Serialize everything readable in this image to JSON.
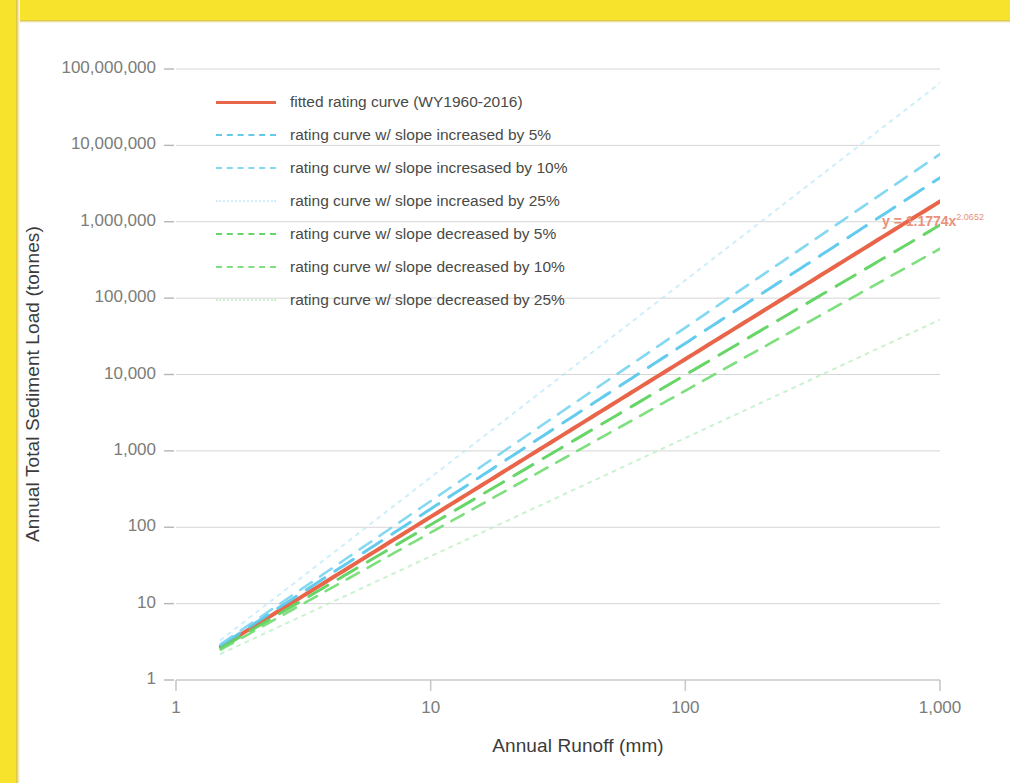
{
  "frame": {
    "border_color": "#F7E32B"
  },
  "chart_data": {
    "type": "line",
    "title": "",
    "xlabel": "Annual Runoff (mm)",
    "ylabel": "Annual Total Sediment Load (tonnes)",
    "xscale": "log",
    "yscale": "log",
    "xlim": [
      1,
      1000
    ],
    "ylim": [
      1,
      100000000
    ],
    "xticks": [
      1,
      10,
      100,
      1000
    ],
    "xtick_labels": [
      "1",
      "10",
      "100",
      "1,000"
    ],
    "yticks": [
      1,
      10,
      100,
      1000,
      10000,
      100000,
      1000000,
      10000000,
      100000000
    ],
    "ytick_labels": [
      "1",
      "10",
      "100",
      "1,000",
      "10,000",
      "100,000",
      "1,000,000",
      "10,000,000",
      "100,000,000"
    ],
    "grid": "horizontal",
    "grid_color": "#b6b6b6",
    "legend_position": "upper left",
    "annotations": [
      {
        "name": "fitted-equation",
        "text_base": "y = 1.1774x",
        "text_exponent": "2.0652",
        "color": "#E8917B",
        "x": 1000,
        "y": 1800000
      }
    ],
    "x_domain_start": 1.5,
    "x_domain_end": 1000,
    "coefficient": 1.1774,
    "exponent": 2.0652,
    "series": [
      {
        "name": "fitted rating curve (WY1960-2016)",
        "label": "fitted rating curve (WY1960-2016)",
        "color": "#E8654A",
        "dash": "none",
        "width": 4,
        "opacity": 1,
        "slope_factor": 1.0,
        "exponent": 2.0652,
        "y_at_x1000": 1795000
      },
      {
        "name": "rating curve w/ slope increased by 5%",
        "label": "rating curve w/ slope increased by 5%",
        "color": "#5BC8EC",
        "dash": "long",
        "width": 3,
        "opacity": 0.95,
        "slope_factor": 1.05,
        "exponent": 2.16846,
        "y_at_x1000": 3990000
      },
      {
        "name": "rating curve w/ slope incresased by 10%",
        "label": "rating curve w/ slope incresased by 10%",
        "color": "#77D4F0",
        "dash": "medium",
        "width": 2.6,
        "opacity": 0.9,
        "slope_factor": 1.1,
        "exponent": 2.27172,
        "y_at_x1000": 8860000
      },
      {
        "name": "rating curve w/ slope increased by 25%",
        "label": "rating curve w/ slope increased by 25%",
        "color": "#BEE9F8",
        "dash": "dotted",
        "width": 2,
        "opacity": 0.75,
        "slope_factor": 1.25,
        "exponent": 2.5815,
        "y_at_x1000": 62000000
      },
      {
        "name": "rating curve w/ slope decreased by 5%",
        "label": "rating curve w/ slope decreased by 5%",
        "color": "#5FD35F",
        "dash": "long",
        "width": 3,
        "opacity": 0.95,
        "slope_factor": 0.95,
        "exponent": 1.96194,
        "y_at_x1000": 809000
      },
      {
        "name": "rating curve w/ slope decreased by 10%",
        "label": "rating curve w/ slope decreased by 10%",
        "color": "#6FDC6F",
        "dash": "medium",
        "width": 2.6,
        "opacity": 0.9,
        "slope_factor": 0.9,
        "exponent": 1.85868,
        "y_at_x1000": 364000
      },
      {
        "name": "rating curve w/ slope decreased by 25%",
        "label": "rating curve w/ slope decreased by 25%",
        "color": "#BDEFC4",
        "dash": "dotted",
        "width": 2,
        "opacity": 0.8,
        "slope_factor": 0.75,
        "exponent": 1.5489,
        "y_at_x1000": 104000
      }
    ]
  }
}
